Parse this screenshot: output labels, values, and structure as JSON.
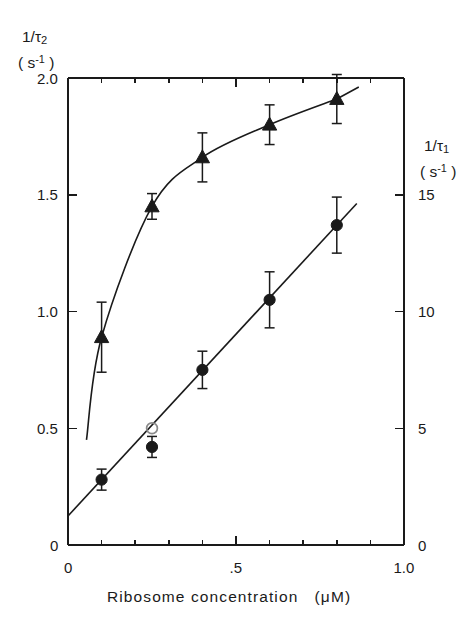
{
  "figure": {
    "background": "#ffffff",
    "ink": "#1a1a1a"
  },
  "axes": {
    "left_title_line1": "1/τ",
    "left_title_sub": "2",
    "left_title_line2_open": "( s",
    "left_title_line2_sup": "-1",
    "left_title_line2_close": " )",
    "right_title_line1": "1/τ",
    "right_title_sub": "1",
    "right_title_line2_open": "( s",
    "right_title_line2_sup": "-1",
    "right_title_line2_close": " )",
    "x_title": "Ribosome concentration",
    "x_units_open": "(",
    "x_units": "μM",
    "x_units_close": ")"
  },
  "ticks": {
    "left_labels": [
      "0",
      "0.5",
      "1.0",
      "1.5",
      "2.0"
    ],
    "left_values": [
      0,
      0.5,
      1.0,
      1.5,
      2.0
    ],
    "right_labels": [
      "0",
      "5",
      "10",
      "15"
    ],
    "right_values": [
      0,
      5,
      10,
      15
    ],
    "x_labels": [
      "0",
      ".5",
      "1.0"
    ],
    "x_values": [
      0,
      0.5,
      1.0
    ]
  },
  "chart_data": {
    "type": "scatter",
    "title": "",
    "xlabel": "Ribosome concentration (μM)",
    "ylabel": "1/τ₂ (s⁻¹)",
    "y2label": "1/τ₁ (s⁻¹)",
    "xlim": [
      0,
      1.0
    ],
    "ylim": [
      0,
      2.1
    ],
    "y2lim": [
      0,
      21
    ],
    "grid": false,
    "legend": "none",
    "x_minor_tick_step": 0.1,
    "series": [
      {
        "name": "1/τ₂",
        "marker": "filled-triangle",
        "axis": "left",
        "curve": "saturating",
        "x": [
          0.1,
          0.25,
          0.4,
          0.6,
          0.8
        ],
        "values": [
          0.89,
          1.45,
          1.66,
          1.8,
          1.91
        ],
        "yerr": [
          0.15,
          0.055,
          0.105,
          0.085,
          0.105
        ]
      },
      {
        "name": "1/τ₁",
        "marker": "filled-circle",
        "axis": "right",
        "curve": "linear",
        "x": [
          0.1,
          0.25,
          0.4,
          0.6,
          0.8
        ],
        "values": [
          2.8,
          4.2,
          7.5,
          10.5,
          13.7
        ],
        "yerr": [
          0.45,
          0.45,
          0.8,
          1.2,
          1.2
        ]
      },
      {
        "name": "1/τ₁ open",
        "marker": "open-circle",
        "axis": "right",
        "curve": "none",
        "x": [
          0.25
        ],
        "values": [
          5.0
        ],
        "yerr": [
          0
        ]
      }
    ]
  }
}
